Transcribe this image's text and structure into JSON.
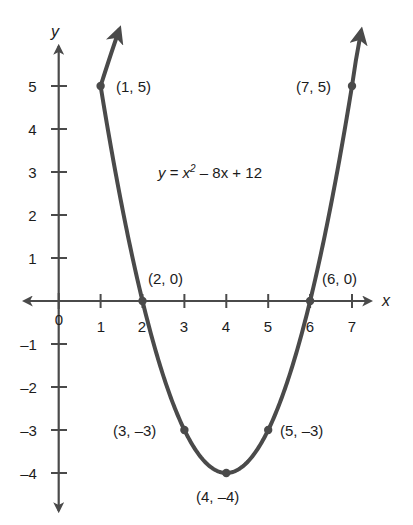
{
  "chart_data": {
    "type": "line",
    "title": "",
    "subtitle": "",
    "xlabel": "x",
    "ylabel": "y",
    "equation_label": "y = x² − 8x + 12",
    "equation_parts": {
      "lhs": "y",
      "eq": "=",
      "var": "x",
      "exp": "2",
      "rest": "– 8x + 12"
    },
    "grid": false,
    "legend": "none",
    "xlim": [
      -0.6,
      7.8
    ],
    "ylim": [
      -4.9,
      5.9
    ],
    "xticks": [
      0,
      1,
      2,
      3,
      4,
      5,
      6,
      7
    ],
    "xtick_labels": [
      "0",
      "1",
      "2",
      "3",
      "4",
      "5",
      "6",
      "7"
    ],
    "yticks": [
      -4,
      -3,
      -2,
      -1,
      1,
      2,
      3,
      4,
      5
    ],
    "ytick_labels": [
      "–4",
      "–3",
      "–2",
      "–1",
      "1",
      "2",
      "3",
      "4",
      "5"
    ],
    "series": [
      {
        "name": "y = x^2 - 8x + 12",
        "x": [
          1,
          2,
          3,
          4,
          5,
          6,
          7
        ],
        "values": [
          5,
          0,
          -3,
          -4,
          -3,
          0,
          5
        ],
        "color": "#4a4a4a"
      }
    ],
    "marked_points": [
      {
        "x": 1,
        "y": 5,
        "label": "(1, 5)",
        "label_pos": "right"
      },
      {
        "x": 2,
        "y": 0,
        "label": "(2, 0)",
        "label_pos": "upper-right"
      },
      {
        "x": 3,
        "y": -3,
        "label": "(3, –3)",
        "label_pos": "left"
      },
      {
        "x": 4,
        "y": -4,
        "label": "(4, –4)",
        "label_pos": "below"
      },
      {
        "x": 5,
        "y": -3,
        "label": "(5, –3)",
        "label_pos": "right"
      },
      {
        "x": 6,
        "y": 0,
        "label": "(6, 0)",
        "label_pos": "upper-right"
      },
      {
        "x": 7,
        "y": 5,
        "label": "(7, 5)",
        "label_pos": "left"
      }
    ],
    "axis_arrows": [
      "x-positive",
      "x-negative",
      "y-positive",
      "y-negative"
    ],
    "curve_arrows": [
      "left-branch-up",
      "right-branch-up"
    ],
    "colors": {
      "curve": "#4a4a4a",
      "axis": "#4a4a4a",
      "text": "#1c1c1c",
      "background": "#ffffff"
    }
  }
}
